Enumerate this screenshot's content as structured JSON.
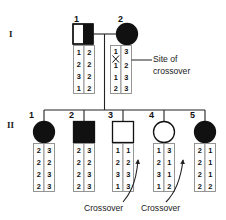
{
  "figure": {
    "type": "pedigree-haplotype-diagram",
    "generations": [
      {
        "label": "I"
      },
      {
        "label": "II"
      }
    ]
  },
  "generation_I": {
    "label": "I",
    "individuals": [
      {
        "number": "1",
        "sex": "male",
        "symbol": "square",
        "fill": "half-filled-right",
        "status": "carrier",
        "haplotypes": {
          "left": [
            "1",
            "2",
            "3",
            "1"
          ],
          "right": [
            "2",
            "2",
            "2",
            "2"
          ]
        }
      },
      {
        "number": "2",
        "sex": "female",
        "symbol": "circle",
        "fill": "filled",
        "status": "affected",
        "haplotypes": {
          "left": [
            "1",
            "1",
            "1",
            "2"
          ],
          "right": [
            "3",
            "2",
            "3",
            "3"
          ]
        },
        "crossover_marker": {
          "glyph": "X",
          "between_rows": [
            1,
            2
          ],
          "column": "left"
        }
      }
    ]
  },
  "generation_II": {
    "label": "II",
    "individuals": [
      {
        "number": "1",
        "sex": "female",
        "symbol": "circle",
        "fill": "filled",
        "status": "affected",
        "haplotypes": {
          "left": [
            "2",
            "2",
            "2",
            "2"
          ],
          "right": [
            "3",
            "2",
            "3",
            "3"
          ]
        }
      },
      {
        "number": "2",
        "sex": "male",
        "symbol": "square",
        "fill": "filled",
        "status": "affected",
        "haplotypes": {
          "left": [
            "2",
            "2",
            "2",
            "2"
          ],
          "right": [
            "3",
            "2",
            "3",
            "3"
          ]
        }
      },
      {
        "number": "3",
        "sex": "male",
        "symbol": "square",
        "fill": "open",
        "status": "unaffected",
        "haplotypes": {
          "left": [
            "1",
            "2",
            "3",
            "1"
          ],
          "right": [
            "1",
            "2",
            "3",
            "3"
          ]
        },
        "recombinant": true
      },
      {
        "number": "4",
        "sex": "female",
        "symbol": "circle",
        "fill": "open",
        "status": "unaffected",
        "haplotypes": {
          "left": [
            "1",
            "2",
            "3",
            "1"
          ],
          "right": [
            "3",
            "1",
            "1",
            "2"
          ]
        }
      },
      {
        "number": "5",
        "sex": "female",
        "symbol": "circle",
        "fill": "filled",
        "status": "affected",
        "haplotypes": {
          "left": [
            "2",
            "2",
            "2",
            "2"
          ],
          "right": [
            "1",
            "1",
            "1",
            "2"
          ]
        },
        "recombinant": true
      }
    ]
  },
  "annotations": {
    "site_of_crossover": {
      "line1": "Site of",
      "line2": "crossover"
    },
    "crossover_left": "Crossover",
    "crossover_right": "Crossover"
  },
  "colors": {
    "affected": "#111111",
    "unaffected": "#ffffff",
    "line": "#222222",
    "box_border": "#8a8a8a",
    "text": "#111111"
  }
}
